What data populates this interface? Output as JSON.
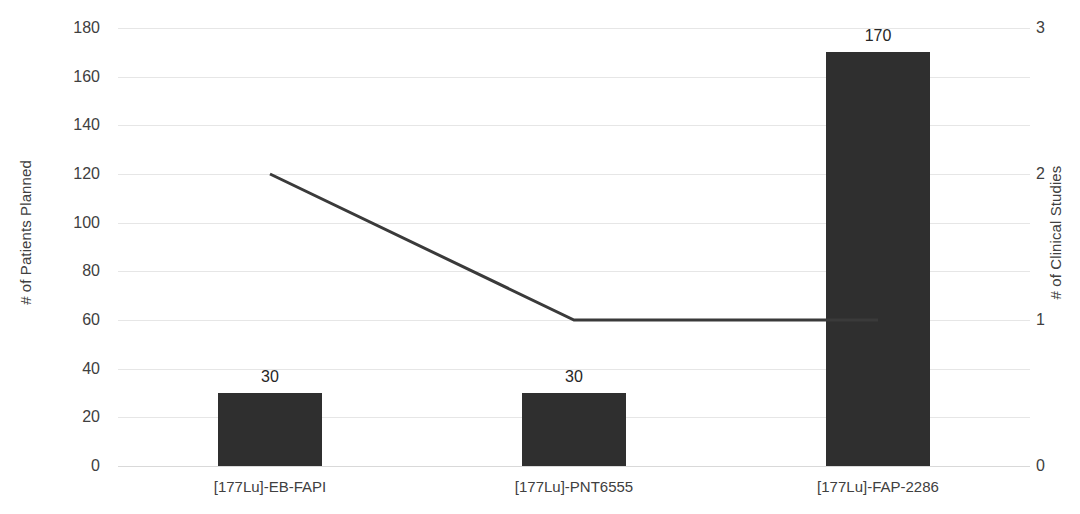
{
  "chart_data": {
    "type": "bar",
    "title": "",
    "subtitle": "",
    "categories": [
      "[177Lu]-EB-FAPI",
      "[177Lu]-PNT6555",
      "[177Lu]-FAP-2286"
    ],
    "series": [
      {
        "name": "# of Patients Planned",
        "type": "bar",
        "axis": "left",
        "values": [
          30,
          30,
          170
        ],
        "data_labels": [
          "30",
          "30",
          "170"
        ],
        "color": "#2f2f2f"
      },
      {
        "name": "# of Clinical Studies",
        "type": "line",
        "axis": "right",
        "values": [
          2,
          1,
          1
        ],
        "color": "#3a3a3a"
      }
    ],
    "xlabel": "",
    "ylabel": "# of Patients Planned",
    "y2label": "# of Clinical Studies",
    "ylim": [
      0,
      180
    ],
    "y2lim": [
      0,
      3
    ],
    "yticks": [
      0,
      20,
      40,
      60,
      80,
      100,
      120,
      140,
      160,
      180
    ],
    "ytick_labels": [
      "0",
      "20",
      "40",
      "60",
      "80",
      "100",
      "120",
      "140",
      "160",
      "180"
    ],
    "y2ticks": [
      0,
      1,
      2,
      3
    ],
    "y2tick_labels": [
      "0",
      "1",
      "2",
      "3"
    ],
    "grid": true,
    "grid_color": "#e6e6e6",
    "legend": "none",
    "background": "#ffffff"
  },
  "axes": {
    "left_title": "# of Patients Planned",
    "right_title": "# of Clinical Studies"
  }
}
